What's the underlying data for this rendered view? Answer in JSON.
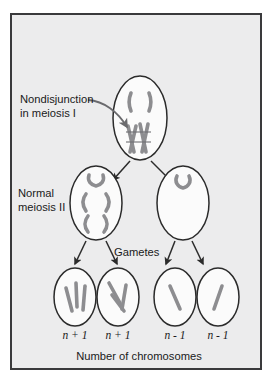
{
  "figure": {
    "title_alt": "Nondisjunction in meiosis I producing aneuploid gametes",
    "background_color": "#ececed",
    "frame_color": "#3a3a3c",
    "cell_fill": "#fbfbfb",
    "cell_stroke": "#2b2b2b",
    "chromosome_color": "#a9a9ab",
    "arrow_color": "#2b2b2b"
  },
  "labels": {
    "nondisjunction_line1": "Nondisjunction",
    "nondisjunction_line2": "in meiosis I",
    "normal_line1": "Normal",
    "normal_line2": "meiosis II",
    "gametes": "Gametes",
    "caption": "Number of chromosomes"
  },
  "ploidy": {
    "g1": "n + 1",
    "g2": "n + 1",
    "g3": "n - 1",
    "g4": "n - 1"
  },
  "stages": [
    {
      "name": "meiosis-i-cell",
      "chromosome_count": 6,
      "description": "Parent cell with one separated homolog pair at top and four chromatids clustered together (nondisjunction)"
    },
    {
      "name": "meiosis-ii-cell-left",
      "chromosome_count": 3,
      "description": "Daughter cell with three chromosomes, n + 1"
    },
    {
      "name": "meiosis-ii-cell-right",
      "chromosome_count": 1,
      "description": "Daughter cell with one chromosome, n - 1"
    }
  ],
  "gametes": [
    {
      "name": "gamete-1",
      "chromosome_count": 3,
      "ploidy": "n + 1"
    },
    {
      "name": "gamete-2",
      "chromosome_count": 3,
      "ploidy": "n + 1"
    },
    {
      "name": "gamete-3",
      "chromosome_count": 1,
      "ploidy": "n - 1"
    },
    {
      "name": "gamete-4",
      "chromosome_count": 1,
      "ploidy": "n - 1"
    }
  ]
}
